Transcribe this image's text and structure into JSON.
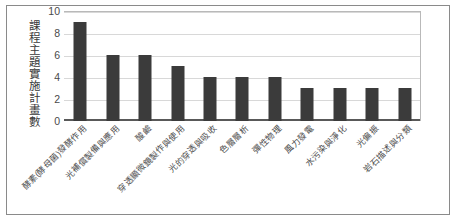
{
  "chart_data": {
    "type": "bar",
    "title": "",
    "xlabel": "",
    "ylabel": "課程主題實施計畫數",
    "ylim": [
      0,
      10
    ],
    "yticks": [
      0,
      2,
      4,
      6,
      8,
      10
    ],
    "grid": true,
    "legend": false,
    "bar_color": "#3b3b3b",
    "categories": [
      "酵素(酵母菌)發酵作用",
      "光補償製備與應用",
      "酸鹼",
      "穿透顯微鏡製作與使用",
      "光的穿透與吸收",
      "色層層析",
      "彈性物理",
      "風力發電",
      "水污染與淨化",
      "光偏振",
      "岩石描述與分類"
    ],
    "values": [
      9,
      6,
      6,
      5,
      4,
      4,
      4,
      3,
      3,
      3,
      3
    ]
  }
}
